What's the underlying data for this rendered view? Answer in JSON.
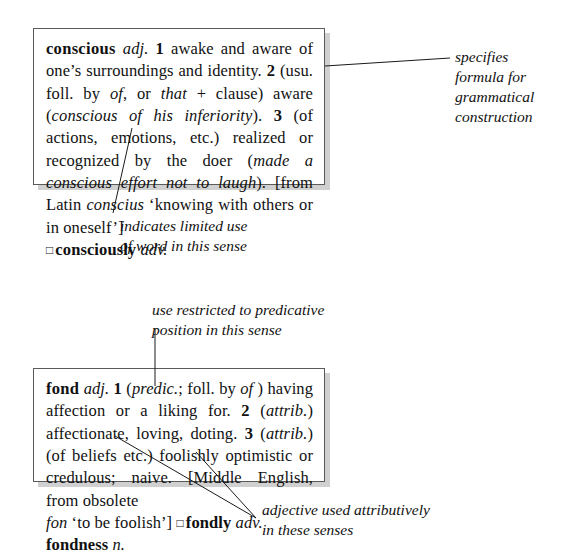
{
  "figure": {
    "type": "annotated-dictionary-entries"
  },
  "entries": [
    {
      "id": "conscious",
      "headword": "conscious",
      "part_of_speech": "adj.",
      "lines": [
        "conscious adj. 1 awake and aware of one's",
        "surroundings and identity. 2 (usu. foll. by of, or that",
        "+ clause) aware (conscious of his inferiority). 3 (of",
        "actions, emotions, etc.) realized or recognized by",
        "the doer (made a conscious effort not to laugh). [from",
        "Latin conscius 'knowing with others or in oneself']",
        "□ consciously adv."
      ],
      "senses": [
        {
          "number": "1",
          "definition": "awake and aware of one's surroundings and identity."
        },
        {
          "number": "2",
          "label": "(usu. foll. by of, or that + clause)",
          "definition": "aware",
          "example": "conscious of his inferiority"
        },
        {
          "number": "3",
          "label": "(of actions, emotions, etc.)",
          "definition": "realized or recognized by the doer",
          "example": "made a conscious effort not to laugh"
        }
      ],
      "etymology": "[from Latin conscius 'knowing with others or in oneself']",
      "derivative": "□ consciously adv."
    },
    {
      "id": "fond",
      "headword": "fond",
      "part_of_speech": "adj.",
      "lines": [
        "fond adj. 1 (predic.; foll. by of ) having affection or a",
        "liking for. 2 (attrib.) affectionate, loving, doting.",
        "3 (attrib.) (of beliefs etc.) foolishly optimistic or",
        "credulous; naive. [Middle English, from obsolete",
        "fon 'to be foolish'] □ fondly adv. fondness n."
      ],
      "senses": [
        {
          "number": "1",
          "label": "(predic.; foll. by of )",
          "definition": "having affection or a liking for."
        },
        {
          "number": "2",
          "label": "(attrib.)",
          "definition": "affectionate, loving, doting."
        },
        {
          "number": "3",
          "label": "(attrib.) (of beliefs etc.)",
          "definition": "foolishly optimistic or credulous; naive."
        }
      ],
      "etymology": "[Middle English, from obsolete fon 'to be foolish']",
      "derivative": "□ fondly adv. fondness n."
    }
  ],
  "annotations": {
    "formula": "specifies\nformula for\ngrammatical\nconstruction",
    "limited_use": "indicates limited use\nof word in this sense",
    "predicative": "use restricted to predicative\nposition in this sense",
    "attributive": "adjective used attributively\nin these senses"
  },
  "colors": {
    "text": "#111111",
    "box_border": "#5a5a5a",
    "box_shadow": "#aaaaaa",
    "page_background": "#ffffff",
    "leader_line": "#1a1a1a"
  }
}
